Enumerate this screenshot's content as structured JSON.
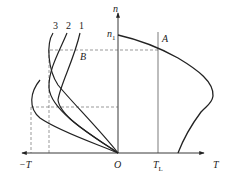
{
  "diagram": {
    "type": "mechanical-characteristic",
    "axes": {
      "vertical_label": "n",
      "horizontal_pos_label": "T",
      "horizontal_neg_label": "−T",
      "origin_label": "O"
    },
    "markers": {
      "n1": "n",
      "n1_sub": "1",
      "T1": "T",
      "T1_sub": "L",
      "point_A": "A",
      "point_B": "B"
    },
    "curve_labels": [
      "3",
      "2",
      "1"
    ],
    "colors": {
      "stroke": "#222222",
      "dashed": "#555555",
      "background": "#ffffff"
    }
  }
}
